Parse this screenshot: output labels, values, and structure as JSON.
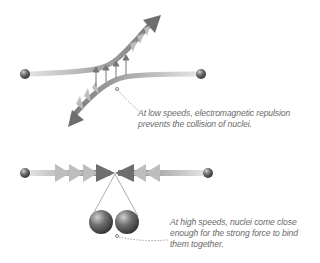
{
  "diagram": {
    "panels": [
      {
        "id": "low-speed",
        "caption": [
          "At low speeds, electromagnetic repulsion",
          "prevents the collision of nuclei."
        ]
      },
      {
        "id": "high-speed",
        "caption": [
          "At high speeds, nuclei come close",
          "enough for the strong force to bind",
          "them together."
        ]
      }
    ],
    "colors": {
      "background": "#ffffff",
      "track_dark": "#6e6e6e",
      "track_light": "#d8d8d8",
      "chevron": "#bdbdbd",
      "nucleus": "#5a5a5a",
      "caption_text": "#6a6a6a"
    }
  }
}
